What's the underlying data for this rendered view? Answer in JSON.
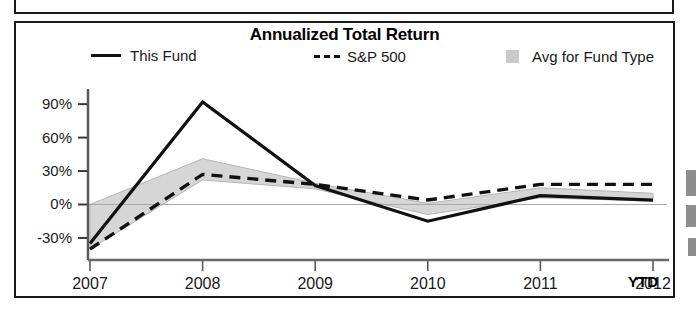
{
  "chart": {
    "title": "Annualized Total Return",
    "legend": [
      {
        "label": "This Fund",
        "marker": "solid-line",
        "color": "#111111"
      },
      {
        "label": "S&P 500",
        "marker": "dashed-line",
        "color": "#111111"
      },
      {
        "label": "Avg for Fund Type",
        "marker": "filled-box",
        "color": "#c9c9c9"
      }
    ],
    "axis_note": "YTD"
  },
  "chart_data": {
    "type": "line",
    "title": "Annualized Total Return",
    "xlabel": "",
    "ylabel": "",
    "x": [
      "2007",
      "2008",
      "2009",
      "2010",
      "2011",
      "2012"
    ],
    "categories": [
      "2007",
      "2008",
      "2009",
      "2010",
      "2011",
      "2012"
    ],
    "ytick_labels": [
      "90%",
      "60%",
      "30%",
      "0%",
      "-30%"
    ],
    "yticks": [
      90,
      60,
      30,
      0,
      -30
    ],
    "ylim": [
      -48,
      100
    ],
    "grid": false,
    "legend_position": "top",
    "series": [
      {
        "name": "This Fund",
        "style": "solid",
        "color": "#111111",
        "values": [
          -35,
          92,
          17,
          -15,
          8,
          4
        ]
      },
      {
        "name": "S&P 500",
        "style": "dashed",
        "color": "#111111",
        "values": [
          -40,
          27,
          18,
          4,
          18,
          18
        ]
      },
      {
        "name": "Avg for Fund Type",
        "style": "shaded-band",
        "color": "#c9c9c9",
        "upper": [
          0,
          41,
          19,
          1,
          15,
          10
        ],
        "lower": [
          -40,
          22,
          14,
          -9,
          6,
          3
        ]
      }
    ],
    "annotations": [
      "YTD"
    ]
  }
}
